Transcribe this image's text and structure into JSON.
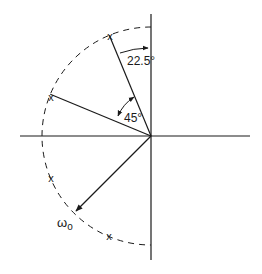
{
  "diagram": {
    "origin": [
      151,
      136
    ],
    "radius": 109,
    "colors": {
      "ink": "#1a1a1a",
      "background": "#ffffff"
    },
    "labels": {
      "angle_small": "22.5°",
      "angle_large": "45°",
      "radius_label": "ω",
      "radius_subscript": "o",
      "pole_marker": "x"
    },
    "poles_angles_deg_from_pos_x": [
      112.5,
      157.5,
      202.5,
      247.5
    ],
    "angles": [
      {
        "label": "22.5°",
        "from_deg": 90,
        "to_deg": 112.5
      },
      {
        "label": "45°",
        "from_deg": 112.5,
        "to_deg": 157.5
      }
    ]
  }
}
